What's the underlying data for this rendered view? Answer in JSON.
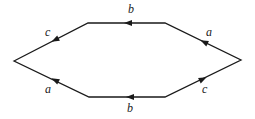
{
  "diagram": {
    "type": "hexagon-directed-edges",
    "vertices": [
      {
        "id": "left",
        "x": 14,
        "y": 61
      },
      {
        "id": "top-left",
        "x": 88,
        "y": 23
      },
      {
        "id": "top-right",
        "x": 165,
        "y": 23
      },
      {
        "id": "right",
        "x": 241,
        "y": 60
      },
      {
        "id": "bottom-right",
        "x": 165,
        "y": 97
      },
      {
        "id": "bottom-left",
        "x": 89,
        "y": 97
      }
    ],
    "edges": [
      {
        "from": "right",
        "to": "top-right",
        "label": "a"
      },
      {
        "from": "top-right",
        "to": "top-left",
        "label": "b"
      },
      {
        "from": "top-left",
        "to": "left",
        "label": "c"
      },
      {
        "from": "bottom-left",
        "to": "left",
        "label": "a"
      },
      {
        "from": "bottom-right",
        "to": "bottom-left",
        "label": "b"
      },
      {
        "from": "right",
        "to": "bottom-right",
        "label": "c"
      }
    ],
    "labels": {
      "top_b": "b",
      "top_right_a": "a",
      "top_left_c": "c",
      "bottom_left_a": "a",
      "bottom_b": "b",
      "bottom_right_c": "c"
    },
    "colors": {
      "stroke": "#1a1a1a",
      "background": "#ffffff"
    }
  }
}
